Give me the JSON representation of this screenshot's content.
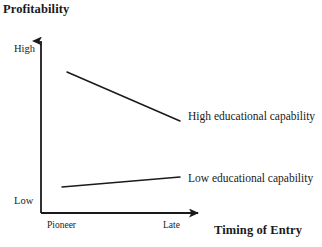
{
  "chart_data": {
    "type": "line",
    "title": "Profitability",
    "xlabel": "Timing of Entry",
    "ylabel": "Profitability",
    "grid": false,
    "legend_position": "inline-right",
    "x_tick_labels": [
      "Pioneer",
      "Late"
    ],
    "y_tick_labels": [
      "High",
      "Low"
    ],
    "xlim": [
      0,
      1
    ],
    "ylim": [
      0,
      1
    ],
    "axis_style": "arrowed-open",
    "series": [
      {
        "name": "High educational capability",
        "label": "High educational capability",
        "x": [
          0.19,
          1.0
        ],
        "values": [
          0.93,
          0.57
        ],
        "trend": "decreasing",
        "color": "#1a1a1a",
        "points": [
          {
            "x_px": 67,
            "y_px": 72
          },
          {
            "x_px": 180,
            "y_px": 121
          }
        ]
      },
      {
        "name": "Low educational capability",
        "label": "Low educational capability",
        "x": [
          0.16,
          1.0
        ],
        "values": [
          0.15,
          0.22
        ],
        "trend": "increasing",
        "color": "#1a1a1a",
        "points": [
          {
            "x_px": 62,
            "y_px": 187
          },
          {
            "x_px": 180,
            "y_px": 177
          }
        ]
      }
    ],
    "axes_geometry": {
      "origin_x_px": 41,
      "origin_y_px": 213,
      "y_axis_top_px": 33,
      "x_axis_right_px": 207
    },
    "colors": {
      "axis": "#1a1a1a",
      "background": "#ffffff",
      "text": "#1a1a1a"
    }
  }
}
